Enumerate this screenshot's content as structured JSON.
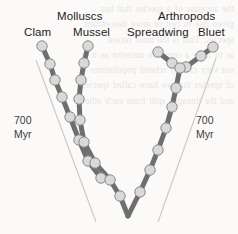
{
  "figure": {
    "type": "phylogenetic-tree",
    "background_ghost_text": "the ancestor of a species that has\ngiven rise to two or more descendant\nspecies. This is the most recent\nas to have a common ancestor as it is\nnot very closely related populations\nof species that we have called species\nand the lineages split from each other",
    "groups": [
      {
        "name": "molluscs",
        "label": "Molluscs"
      },
      {
        "name": "arthropods",
        "label": "Arthropods"
      }
    ],
    "taxa": [
      {
        "name": "clam",
        "label": "Clam"
      },
      {
        "name": "mussel",
        "label": "Mussel"
      },
      {
        "name": "spreadwing",
        "label": "Spreadwing"
      },
      {
        "name": "bluet",
        "label": "Bluet"
      }
    ],
    "scale_annotations": [
      {
        "name": "scale-left",
        "value": "700",
        "unit": "Myr"
      },
      {
        "name": "scale-right",
        "value": "700",
        "unit": "Myr"
      }
    ],
    "colors": {
      "branch": "#6e6e6e",
      "node_fill": "#d9d9d9",
      "node_stroke": "#8a8a8a",
      "guide_line": "#c8c8c8",
      "text": "#1b1b1b",
      "background": "#fbfaf8"
    }
  },
  "chart_data": {
    "type": "tree",
    "title": "",
    "root": {
      "x": 128,
      "y": 216
    },
    "lineages": [
      {
        "taxon": "Clam",
        "group": "Molluscs",
        "points": [
          [
            42,
            46
          ],
          [
            50,
            64
          ],
          [
            55,
            80
          ],
          [
            62,
            97
          ],
          [
            70,
            117
          ],
          [
            79,
            140
          ],
          [
            88,
            161
          ],
          [
            101,
            178
          ]
        ]
      },
      {
        "taxon": "Mussel",
        "group": "Molluscs",
        "points": [
          [
            88,
            46
          ],
          [
            84,
            63
          ],
          [
            81,
            80
          ],
          [
            79,
            99
          ],
          [
            80,
            120
          ],
          [
            84,
            142
          ],
          [
            95,
            163
          ],
          [
            110,
            180
          ],
          [
            120,
            196
          ],
          [
            128,
            216
          ]
        ]
      },
      {
        "taxon": "Spreadwing",
        "group": "Arthropods",
        "points": [
          [
            158,
            52
          ],
          [
            172,
            63
          ]
        ]
      },
      {
        "taxon": "Bluet",
        "group": "Arthropods",
        "points": [
          [
            213,
            47
          ],
          [
            201,
            56
          ],
          [
            186,
            67
          ]
        ]
      },
      {
        "taxon": "Arthropod-stem",
        "group": "Arthropods",
        "points": [
          [
            180,
            68
          ],
          [
            176,
            88
          ],
          [
            172,
            107
          ],
          [
            166,
            128
          ],
          [
            158,
            150
          ],
          [
            150,
            170
          ],
          [
            140,
            192
          ],
          [
            128,
            216
          ]
        ]
      }
    ],
    "guide_lines": [
      {
        "name": "guide-left",
        "from": [
          36,
          60
        ],
        "to": [
          96,
          222
        ]
      },
      {
        "name": "guide-right",
        "from": [
          216,
          58
        ],
        "to": [
          158,
          222
        ]
      }
    ],
    "node_radius": 5.2,
    "branch_width": 5.0
  }
}
